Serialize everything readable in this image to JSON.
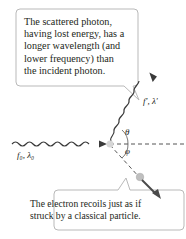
{
  "figure": {
    "topic": "Compton scattering",
    "callouts": {
      "scattered_photon": {
        "lines": [
          "The scattered photon,",
          "having lost energy, has a",
          "longer wavelength (and",
          "lower frequency) than",
          "the incident photon."
        ]
      },
      "electron": {
        "lines": [
          "The electron recoils just as if",
          "struck by a classical particle."
        ]
      }
    },
    "labels": {
      "incident": "f₀, λ₀",
      "scattered": "f′, λ′",
      "theta": "θ",
      "phi": "φ"
    },
    "colors": {
      "callout_border": "#b9b9b9",
      "wave": "#3a3a3a",
      "dashed_line": "#555555",
      "arrow": "#4a4a4a",
      "electron": "#bfbfbf",
      "text": "#231f20"
    }
  }
}
